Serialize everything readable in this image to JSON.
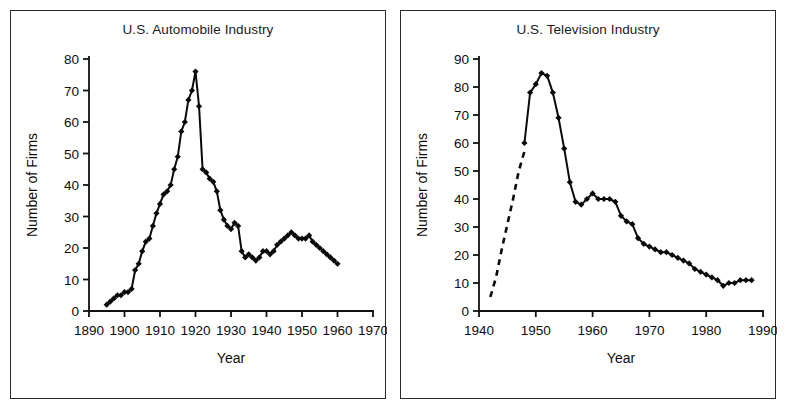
{
  "figure": {
    "panels": [
      "auto",
      "tv"
    ]
  },
  "chart_data": [
    {
      "id": "auto",
      "type": "line",
      "title": "U.S. Automobile Industry",
      "xlabel": "Year",
      "ylabel": "Number of Firms",
      "xlim": [
        1890,
        1970
      ],
      "ylim": [
        0,
        80
      ],
      "xticks": [
        1890,
        1900,
        1910,
        1920,
        1930,
        1940,
        1950,
        1960,
        1970
      ],
      "xticklabels": [
        "1890",
        "1900",
        "1910",
        "1920",
        "1930",
        "1940",
        "1950",
        "1960",
        "1970"
      ],
      "yticks": [
        0,
        10,
        20,
        30,
        40,
        50,
        60,
        70,
        80
      ],
      "yticklabels": [
        "0",
        "10",
        "20",
        "30",
        "40",
        "50",
        "60",
        "70",
        "80"
      ],
      "grid": false,
      "legend": "none",
      "markers": "filled-diamond",
      "series": [
        {
          "name": "Number of Firms",
          "x": [
            1895,
            1896,
            1897,
            1898,
            1899,
            1900,
            1901,
            1902,
            1903,
            1904,
            1905,
            1906,
            1907,
            1908,
            1909,
            1910,
            1911,
            1912,
            1913,
            1914,
            1915,
            1916,
            1917,
            1918,
            1919,
            1920,
            1921,
            1922,
            1923,
            1924,
            1925,
            1926,
            1927,
            1928,
            1929,
            1930,
            1931,
            1932,
            1933,
            1934,
            1935,
            1936,
            1937,
            1938,
            1939,
            1940,
            1941,
            1942,
            1943,
            1944,
            1945,
            1946,
            1947,
            1948,
            1949,
            1950,
            1951,
            1952,
            1953,
            1954,
            1955,
            1956,
            1957,
            1958,
            1959,
            1960
          ],
          "values": [
            2,
            3,
            4,
            5,
            5,
            6,
            6,
            7,
            13,
            15,
            19,
            22,
            23,
            27,
            31,
            34,
            37,
            38,
            40,
            45,
            49,
            57,
            60,
            67,
            70,
            76,
            65,
            45,
            44,
            42,
            41,
            38,
            32,
            29,
            27,
            26,
            28,
            27,
            19,
            17,
            18,
            17,
            16,
            17,
            19,
            19,
            18,
            19,
            21,
            22,
            23,
            24,
            25,
            24,
            23,
            23,
            23,
            24,
            22,
            21,
            20,
            19,
            18,
            17,
            16,
            15
          ]
        }
      ]
    },
    {
      "id": "tv",
      "type": "line",
      "title": "U.S. Television Industry",
      "xlabel": "Year",
      "ylabel": "Number of Firms",
      "xlim": [
        1940,
        1990
      ],
      "ylim": [
        0,
        90
      ],
      "xticks": [
        1940,
        1950,
        1960,
        1970,
        1980,
        1990
      ],
      "xticklabels": [
        "1940",
        "1950",
        "1960",
        "1970",
        "1980",
        "1990"
      ],
      "yticks": [
        0,
        10,
        20,
        30,
        40,
        50,
        60,
        70,
        80,
        90
      ],
      "yticklabels": [
        "0",
        "10",
        "20",
        "30",
        "40",
        "50",
        "60",
        "70",
        "80",
        "90"
      ],
      "grid": false,
      "legend": "none",
      "markers": "filled-diamond",
      "dashed_segment": {
        "note": "estimated early entry, drawn as dashed curve",
        "x": [
          1942,
          1943,
          1944,
          1945,
          1946,
          1947,
          1948
        ],
        "values": [
          5,
          12,
          22,
          31,
          40,
          50,
          57
        ]
      },
      "series": [
        {
          "name": "Number of Firms",
          "x": [
            1948,
            1949,
            1950,
            1951,
            1952,
            1953,
            1954,
            1955,
            1956,
            1957,
            1958,
            1959,
            1960,
            1961,
            1962,
            1963,
            1964,
            1965,
            1966,
            1967,
            1968,
            1969,
            1970,
            1971,
            1972,
            1973,
            1974,
            1975,
            1976,
            1977,
            1978,
            1979,
            1980,
            1981,
            1982,
            1983,
            1984,
            1985,
            1986,
            1987,
            1988
          ],
          "values": [
            60,
            78,
            81,
            85,
            84,
            78,
            69,
            58,
            46,
            39,
            38,
            40,
            42,
            40,
            40,
            40,
            39,
            34,
            32,
            31,
            26,
            24,
            23,
            22,
            21,
            21,
            20,
            19,
            18,
            17,
            15,
            14,
            13,
            12,
            11,
            9,
            10,
            10,
            11,
            11,
            11
          ]
        }
      ]
    }
  ]
}
